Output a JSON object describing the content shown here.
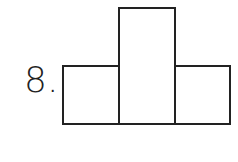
{
  "problem": {
    "number_label": "8."
  },
  "figure": {
    "type": "composite-rectangles",
    "shapes": [
      {
        "id": "left",
        "kind": "rectangle"
      },
      {
        "id": "middle",
        "kind": "rectangle",
        "note": "taller center rectangle"
      },
      {
        "id": "right",
        "kind": "rectangle"
      }
    ],
    "stroke_color": "#222222"
  }
}
